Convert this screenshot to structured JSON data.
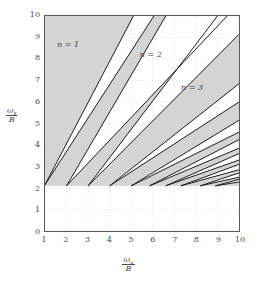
{
  "chart_data": {
    "type": "line",
    "title": "",
    "xlabel": "ω_u / B",
    "ylabel": "ω_s / B",
    "xlim": [
      1,
      10
    ],
    "ylim": [
      0,
      10
    ],
    "xticks": [
      1,
      2,
      3,
      4,
      5,
      6,
      7,
      8,
      9,
      10
    ],
    "yticks": [
      0,
      1,
      2,
      3,
      4,
      5,
      6,
      7,
      8,
      9,
      10
    ],
    "grid": "dotted-light",
    "legend": "none",
    "shaded_region_color": "#d4d4d4",
    "line_color": "#1a1a1a",
    "apex_y": 2.1,
    "annotations": [
      {
        "text": "n = 1",
        "x": 2.1,
        "y": 8.6
      },
      {
        "text": "n = 2",
        "x": 5.9,
        "y": 8.15
      },
      {
        "text": "n = 3",
        "x": 7.8,
        "y": 6.65
      }
    ],
    "series": [
      {
        "name": "tongue-1-left",
        "x": [
          1.0,
          5.1
        ],
        "y": [
          2.15,
          10.0
        ]
      },
      {
        "name": "tongue-1-right",
        "x": [
          1.0,
          6.05
        ],
        "y": [
          2.15,
          10.0
        ]
      },
      {
        "name": "tongue-2-left",
        "x": [
          2.0,
          6.6
        ],
        "y": [
          2.1,
          10.0
        ]
      },
      {
        "name": "tongue-2-right",
        "x": [
          2.0,
          9.45
        ],
        "y": [
          2.1,
          10.0
        ]
      },
      {
        "name": "tongue-3-left",
        "x": [
          3.0,
          9.0
        ],
        "y": [
          2.1,
          10.0
        ]
      },
      {
        "name": "tongue-3-right",
        "x": [
          3.0,
          10.0
        ],
        "y": [
          2.1,
          9.15
        ]
      },
      {
        "name": "tongue-4-left",
        "x": [
          4.0,
          10.0
        ],
        "y": [
          2.1,
          6.85
        ]
      },
      {
        "name": "tongue-4-right",
        "x": [
          4.0,
          10.0
        ],
        "y": [
          2.1,
          6.0
        ]
      },
      {
        "name": "tongue-5-left",
        "x": [
          5.0,
          10.0
        ],
        "y": [
          2.1,
          5.15
        ]
      },
      {
        "name": "tongue-5-right",
        "x": [
          5.0,
          10.0
        ],
        "y": [
          2.1,
          4.6
        ]
      },
      {
        "name": "tongue-6-left",
        "x": [
          5.85,
          10.0
        ],
        "y": [
          2.1,
          4.25
        ]
      },
      {
        "name": "tongue-6-right",
        "x": [
          5.85,
          10.0
        ],
        "y": [
          2.1,
          3.85
        ]
      },
      {
        "name": "tongue-7-left",
        "x": [
          6.6,
          10.0
        ],
        "y": [
          2.1,
          3.6
        ]
      },
      {
        "name": "tongue-7-right",
        "x": [
          6.6,
          10.0
        ],
        "y": [
          2.1,
          3.3
        ]
      },
      {
        "name": "tongue-8-left",
        "x": [
          7.3,
          10.0
        ],
        "y": [
          2.1,
          3.1
        ]
      },
      {
        "name": "tongue-8-right",
        "x": [
          7.3,
          10.0
        ],
        "y": [
          2.1,
          2.85
        ]
      },
      {
        "name": "tongue-9-left",
        "x": [
          8.2,
          10.0
        ],
        "y": [
          2.1,
          2.7
        ]
      },
      {
        "name": "tongue-9-right",
        "x": [
          8.2,
          10.0
        ],
        "y": [
          2.1,
          2.5
        ]
      },
      {
        "name": "tongue-10-left",
        "x": [
          8.9,
          10.0
        ],
        "y": [
          2.1,
          2.4
        ]
      },
      {
        "name": "tongue-10-right",
        "x": [
          8.9,
          10.0
        ],
        "y": [
          2.1,
          2.28
        ]
      }
    ]
  },
  "axes": {
    "y_ticks": [
      "10",
      "9",
      "8",
      "7",
      "6",
      "5",
      "4",
      "3",
      "2",
      "1",
      "0"
    ],
    "x_ticks": [
      "1",
      "2",
      "3",
      "4",
      "5",
      "6",
      "7",
      "8",
      "9",
      "10"
    ],
    "y_label": {
      "numerator_symbol": "ω",
      "numerator_sub": "s",
      "denominator": "B"
    },
    "x_label": {
      "numerator_symbol": "ω",
      "numerator_sub": "u",
      "denominator": "B"
    }
  },
  "annotations": {
    "n1": "n = 1",
    "n2": "n = 2",
    "n3": "n = 3"
  },
  "colors": {
    "shade": "#d4d4d4",
    "line": "#1a1a1a",
    "frame": "#5a5a5a",
    "grid": "#cfcfcf",
    "text": "#4a4a4a",
    "background": "#ffffff"
  }
}
